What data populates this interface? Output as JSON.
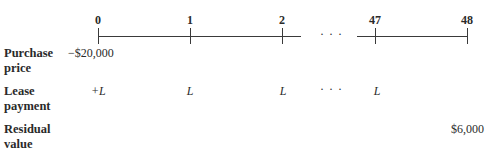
{
  "timeline": {
    "periods": [
      {
        "label": "0",
        "x": 98
      },
      {
        "label": "1",
        "x": 190
      },
      {
        "label": "2",
        "x": 282
      },
      {
        "label": "47",
        "x": 375
      },
      {
        "label": "48",
        "x": 467
      }
    ],
    "ellipsis": "· · ·"
  },
  "rows": [
    {
      "label_line1": "Purchase",
      "label_line2": "price",
      "values": {
        "p0": "−$20,000"
      }
    },
    {
      "label_line1": "Lease",
      "label_line2": "payment",
      "values": {
        "p0": "+L",
        "p1": "L",
        "p2": "L",
        "ellipsis": "· · ·",
        "p47": "L"
      }
    },
    {
      "label_line1": "Residual",
      "label_line2": "value",
      "values": {
        "p48": "$6,000"
      }
    }
  ]
}
